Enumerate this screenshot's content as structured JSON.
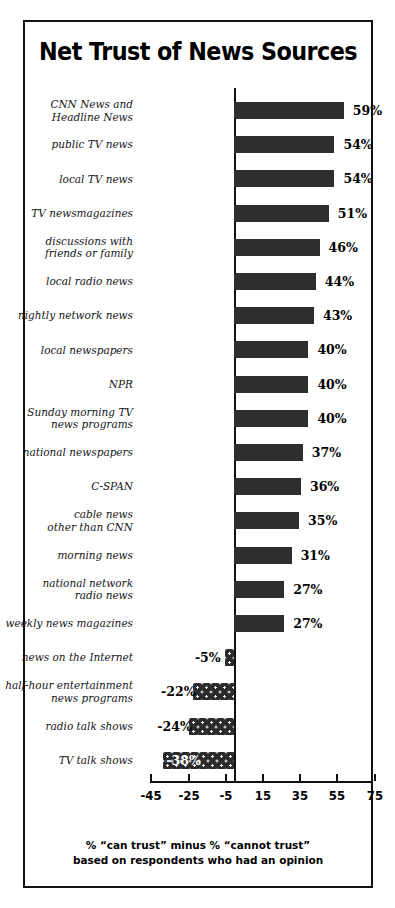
{
  "chart_data": {
    "type": "bar",
    "orientation": "horizontal",
    "title": "Net Trust of News Sources",
    "xlabel": "",
    "ylabel": "",
    "xlim": [
      -45,
      75
    ],
    "grid": false,
    "legend": "none",
    "tick_labels": [
      "-45",
      "-25",
      "-5",
      "15",
      "35",
      "55",
      "75"
    ],
    "tick_values": [
      -45,
      -25,
      -5,
      15,
      35,
      55,
      75
    ],
    "footnote_line1": "% “can trust” minus % “cannot trust”",
    "footnote_line2": "based on respondents who had an opinion",
    "categories": [
      "CNN News and\nHeadline News",
      "public TV news",
      "local TV news",
      "TV newsmagazines",
      "discussions with\nfriends or family",
      "local radio news",
      "nightly network news",
      "local newspapers",
      "NPR",
      "Sunday morning TV\nnews programs",
      "national newspapers",
      "C-SPAN",
      "cable news\nother than CNN",
      "morning news",
      "national network\nradio news",
      "weekly news magazines",
      "news on the Internet",
      "half-hour entertainment\nnews programs",
      "radio talk shows",
      "TV talk shows"
    ],
    "values": [
      59,
      54,
      54,
      51,
      46,
      44,
      43,
      40,
      40,
      40,
      37,
      36,
      35,
      31,
      27,
      27,
      -5,
      -22,
      -24,
      -38
    ],
    "value_labels": [
      "59%",
      "54%",
      "54%",
      "51%",
      "46%",
      "44%",
      "43%",
      "40%",
      "40%",
      "40%",
      "37%",
      "36%",
      "35%",
      "31%",
      "27%",
      "27%",
      "-5%",
      "-22%",
      "-24%",
      "-38%"
    ],
    "colors": {
      "positive_bar": "#2e2e2e",
      "negative_bar": "#2b2b2b",
      "axis": "#111111",
      "text": "#000000",
      "background": "#ffffff"
    }
  }
}
